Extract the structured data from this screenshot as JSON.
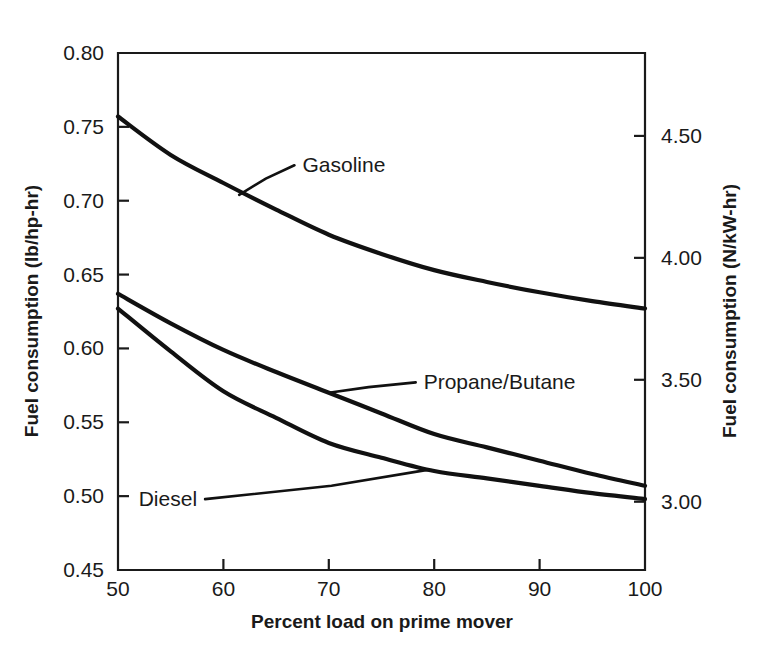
{
  "chart_data": {
    "type": "line",
    "title": "",
    "xlabel": "Percent load on prime mover",
    "ylabel": "Fuel consumption (lb/hp-hr)",
    "ylabel_right": "Fuel consumption (N/kW-hr)",
    "xlim": [
      50,
      100
    ],
    "ylim": [
      0.45,
      0.8
    ],
    "ylim_right": [
      2.72,
      4.84
    ],
    "grid": false,
    "legend_position": "inline-annotations",
    "xticks": [
      50,
      60,
      70,
      80,
      90,
      100
    ],
    "xtick_labels": [
      "50",
      "60",
      "70",
      "80",
      "90",
      "100"
    ],
    "yticks": [
      0.45,
      0.5,
      0.55,
      0.6,
      0.65,
      0.7,
      0.75,
      0.8
    ],
    "ytick_labels": [
      "0.45",
      "0.50",
      "0.55",
      "0.60",
      "0.65",
      "0.70",
      "0.75",
      "0.80"
    ],
    "yticks_right": [
      3.0,
      3.5,
      4.0,
      4.5
    ],
    "ytick_labels_right": [
      "3.00",
      "3.50",
      "4.00",
      "4.50"
    ],
    "x": [
      50,
      55,
      60,
      65,
      70,
      75,
      80,
      85,
      90,
      95,
      100
    ],
    "series": [
      {
        "name": "Gasoline",
        "label": "Gasoline",
        "values": [
          0.757,
          0.731,
          0.712,
          0.694,
          0.677,
          0.664,
          0.653,
          0.645,
          0.638,
          0.632,
          0.627
        ]
      },
      {
        "name": "Propane/Butane",
        "label": "Propane/Butane",
        "values": [
          0.637,
          0.617,
          0.599,
          0.584,
          0.57,
          0.556,
          0.542,
          0.533,
          0.524,
          0.515,
          0.507
        ]
      },
      {
        "name": "Diesel",
        "label": "Diesel",
        "values": [
          0.627,
          0.598,
          0.571,
          0.553,
          0.536,
          0.526,
          0.517,
          0.512,
          0.507,
          0.502,
          0.498
        ]
      }
    ],
    "annotations": [
      {
        "text": "Gasoline",
        "x": 67.5,
        "y": 0.724,
        "anchor_x": 61.5,
        "anchor_y": 0.704
      },
      {
        "text": "Propane/Butane",
        "x": 79.0,
        "y": 0.577,
        "anchor_x": 70.0,
        "anchor_y": 0.57
      },
      {
        "text": "Diesel",
        "x": 57.5,
        "y": 0.498,
        "anchor_x": 79.5,
        "anchor_y": 0.518
      }
    ]
  },
  "colors": {
    "curve": "#111111",
    "axis": "#1a1a1a",
    "background": "#ffffff"
  }
}
